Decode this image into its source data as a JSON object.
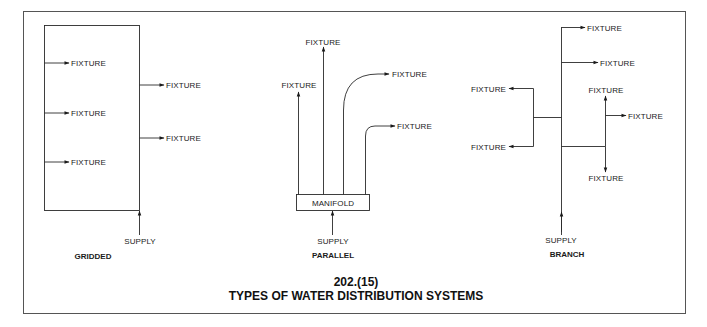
{
  "figure": {
    "number": "202.(15)",
    "title": "TYPES OF WATER DISTRIBUTION SYSTEMS"
  },
  "colors": {
    "line": "#2a2a2a",
    "text": "#1a1a1a",
    "frame": "#555555",
    "background": "#ffffff"
  },
  "gridded": {
    "caption": "GRIDDED",
    "supply_label": "SUPPLY",
    "fixtures": [
      "FIXTURE",
      "FIXTURE",
      "FIXTURE",
      "FIXTURE",
      "FIXTURE"
    ]
  },
  "parallel": {
    "caption": "PARALLEL",
    "supply_label": "SUPPLY",
    "manifold_label": "MANIFOLD",
    "fixtures": [
      "FIXTURE",
      "FIXTURE",
      "FIXTURE",
      "FIXTURE"
    ]
  },
  "branch": {
    "caption": "BRANCH",
    "supply_label": "SUPPLY",
    "fixtures": [
      "FIXTURE",
      "FIXTURE",
      "FIXTURE",
      "FIXTURE",
      "FIXTURE",
      "FIXTURE",
      "FIXTURE"
    ]
  }
}
